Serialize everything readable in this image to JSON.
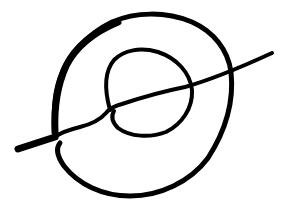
{
  "drawing": {
    "description": "Hand-drawn ink sketch of a large loop, a smaller inner loop, and a diagonal line crossing both",
    "background_color": "#ffffff",
    "ink_color": "#000000",
    "strokes": [
      {
        "name": "outer-loop",
        "stroke_width": 5
      },
      {
        "name": "inner-loop",
        "stroke_width": 4
      },
      {
        "name": "diagonal-line",
        "stroke_width": 4
      }
    ]
  }
}
